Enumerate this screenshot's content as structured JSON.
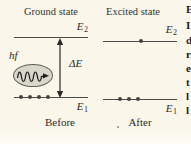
{
  "colors": {
    "background": "#fbf7eb",
    "line": "#4a4a48",
    "text": "#2e2c28",
    "photon_fill": "#d9d7cb"
  },
  "left_panel": {
    "title": "Ground state",
    "upper_label": {
      "symbol": "E",
      "sub": "2"
    },
    "lower_label": {
      "symbol": "E",
      "sub": "1"
    },
    "photon_label": "hf",
    "energy_gap_label": "ΔE",
    "caption": "Before",
    "electrons": {
      "upper": 0,
      "lower": 4
    }
  },
  "right_panel": {
    "title": "Excited state",
    "upper_label": {
      "symbol": "E",
      "sub": "2"
    },
    "lower_label": {
      "symbol": "E",
      "sub": "1"
    },
    "caption": "After",
    "electrons": {
      "upper": 1,
      "lower": 3
    }
  },
  "edge_text_fragments": [
    {
      "ch": "E",
      "top": 4
    },
    {
      "ch": "I",
      "top": 20
    },
    {
      "ch": "d",
      "top": 35
    },
    {
      "ch": "r",
      "top": 49
    },
    {
      "ch": "e",
      "top": 63
    },
    {
      "ch": "t",
      "top": 77
    },
    {
      "ch": "l",
      "top": 91
    },
    {
      "ch": "l",
      "top": 105
    }
  ]
}
